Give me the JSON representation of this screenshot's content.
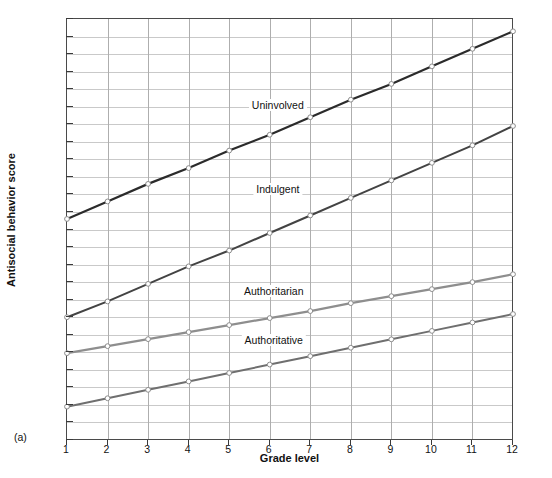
{
  "panel_tag": "(a)",
  "chart_data": {
    "type": "line",
    "title": "",
    "xlabel": "Grade level",
    "ylabel": "Antisocial behavior score",
    "x": [
      1,
      2,
      3,
      4,
      5,
      6,
      7,
      8,
      9,
      10,
      11,
      12
    ],
    "xlim": [
      1,
      12
    ],
    "ylim": [
      0.4,
      2.8
    ],
    "ytick_labels": [
      "0.4",
      "0.5",
      "0.6",
      "0.7",
      "0.8",
      "0.9",
      "1",
      "1.1",
      "1.2",
      "1.3",
      "1.4",
      "1.5",
      "1.6",
      "1.7",
      "1.8",
      "1.9",
      "2",
      "2.1",
      "2.2",
      "2.3",
      "2.4",
      "2.5",
      "2.6",
      "2.7",
      "2.8"
    ],
    "ytick_values": [
      0.4,
      0.5,
      0.6,
      0.7,
      0.8,
      0.9,
      1.0,
      1.1,
      1.2,
      1.3,
      1.4,
      1.5,
      1.6,
      1.7,
      1.8,
      1.9,
      2.0,
      2.1,
      2.2,
      2.3,
      2.4,
      2.5,
      2.6,
      2.7,
      2.8
    ],
    "xtick_labels": [
      "1",
      "2",
      "3",
      "4",
      "5",
      "6",
      "7",
      "8",
      "9",
      "10",
      "11",
      "12"
    ],
    "grid": true,
    "legend_position": "inline-annotations",
    "series": [
      {
        "name": "Uninvolved",
        "color": "#2b2b2b",
        "width": 2.2,
        "label_x": 6.2,
        "label_y": 2.31,
        "values": [
          1.66,
          1.76,
          1.86,
          1.95,
          2.05,
          2.14,
          2.24,
          2.34,
          2.43,
          2.53,
          2.63,
          2.73
        ]
      },
      {
        "name": "Indulgent",
        "color": "#434343",
        "width": 2.0,
        "label_x": 6.2,
        "label_y": 1.83,
        "values": [
          1.1,
          1.19,
          1.29,
          1.39,
          1.48,
          1.58,
          1.68,
          1.78,
          1.88,
          1.98,
          2.08,
          2.19
        ]
      },
      {
        "name": "Authoritarian",
        "color": "#8e8e8e",
        "width": 2.2,
        "label_x": 6.1,
        "label_y": 1.25,
        "values": [
          0.895,
          0.935,
          0.975,
          1.015,
          1.055,
          1.095,
          1.135,
          1.18,
          1.22,
          1.26,
          1.3,
          1.345
        ]
      },
      {
        "name": "Authoritative",
        "color": "#6f6f6f",
        "width": 2.0,
        "label_x": 6.1,
        "label_y": 0.97,
        "values": [
          0.59,
          0.638,
          0.686,
          0.734,
          0.782,
          0.83,
          0.878,
          0.926,
          0.974,
          1.022,
          1.07,
          1.118
        ]
      }
    ]
  }
}
